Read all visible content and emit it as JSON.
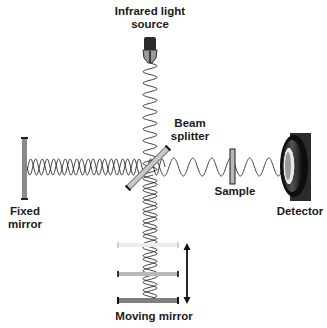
{
  "diagram": {
    "labels": {
      "source_line1": "Infrared light",
      "source_line2": "source",
      "splitter_line1": "Beam",
      "splitter_line2": "splitter",
      "fixed_line1": "Fixed",
      "fixed_line2": "mirror",
      "sample": "Sample",
      "detector": "Detector",
      "moving": "Moving mirror"
    },
    "colors": {
      "wave": "#2a2a2a",
      "mirror_fill": "#8a8a8a",
      "mirror_light": "#e6e6e6",
      "mirror_mid": "#b4b4b4",
      "detector_body": "#2b2b2b",
      "splitter_fill": "#d0d0d0"
    },
    "components": [
      "infrared-source",
      "beam-splitter",
      "fixed-mirror",
      "moving-mirror",
      "sample",
      "detector"
    ]
  }
}
